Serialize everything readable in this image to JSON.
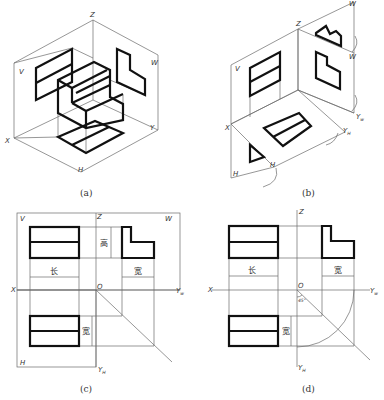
{
  "figures": [
    {
      "id": "a",
      "caption": "(a)",
      "description": "Isometric view of object placed in three-projection-plane system",
      "axis_labels": {
        "z": "Z",
        "v": "V",
        "w": "W",
        "x": "X",
        "y": "Y",
        "h": "H"
      }
    },
    {
      "id": "b",
      "caption": "(b)",
      "description": "Projection planes unfolded (H rotated down, W rotated right)",
      "axis_labels": {
        "z": "Z",
        "v": "V",
        "w_top": "W",
        "w": "W",
        "x": "X",
        "yw": "Y",
        "yw_sub": "w",
        "yh": "Y",
        "yh_sub": "H",
        "h": "H",
        "h_corner": "H"
      }
    },
    {
      "id": "c",
      "caption": "(c)",
      "description": "Three views with projection plane borders",
      "axis_labels": {
        "z": "Z",
        "v": "V",
        "w": "W",
        "x": "X",
        "o": "O",
        "yw": "Y",
        "yw_sub": "w",
        "h": "H",
        "yh": "Y",
        "yh_sub": "H"
      },
      "dimensions": {
        "length": "长",
        "height": "高",
        "width_side": "宽",
        "width_top": "宽"
      }
    },
    {
      "id": "d",
      "caption": "(d)",
      "description": "Three views without borders, with 45° auxiliary line and arc",
      "axis_labels": {
        "z": "Z",
        "x": "X",
        "o": "O",
        "yw": "Y",
        "yw_sub": "w",
        "yh": "Y",
        "yh_sub": "H"
      },
      "angle_label": "45°",
      "dimensions": {
        "length": "长",
        "width_side": "宽",
        "width_top": "宽"
      }
    }
  ]
}
